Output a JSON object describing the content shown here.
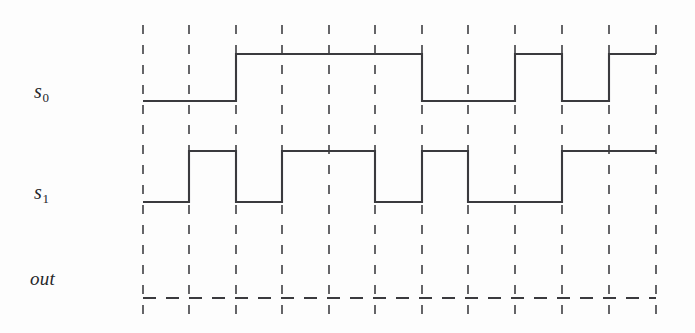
{
  "figure": {
    "type": "timing-diagram",
    "background_color": "#fdfdfd",
    "line_color": "#3a3a3e",
    "grid_color": "#4a4a4e"
  },
  "labels": {
    "s0": {
      "base": "s",
      "sub": "0",
      "full": "s0"
    },
    "s1": {
      "base": "s",
      "sub": "1",
      "full": "s1"
    },
    "out": {
      "full": "out"
    }
  },
  "chart_data": {
    "type": "line",
    "title": "",
    "xlabel": "",
    "ylabel": "",
    "grid": true,
    "legend_position": "left",
    "axis": {
      "x_start_px": 143,
      "x_end_px": 656,
      "cycle_width_px": 46.6,
      "gridline_count": 12,
      "gridlines_px": [
        143,
        189,
        236,
        282,
        329,
        375,
        422,
        468,
        515,
        562,
        609,
        656
      ],
      "gridline_top_px": 25,
      "gridline_bottom_px": 324
    },
    "series": [
      {
        "name": "s0",
        "label": "s0",
        "high_y_px": 54,
        "low_y_px": 101,
        "style": "solid",
        "values": [
          0,
          0,
          1,
          1,
          1,
          1,
          0,
          0,
          1,
          0,
          1
        ],
        "transitions_px": [
          {
            "x": 143,
            "level": 0
          },
          {
            "x": 236,
            "level": 1
          },
          {
            "x": 422,
            "level": 0
          },
          {
            "x": 515,
            "level": 1
          },
          {
            "x": 562,
            "level": 0
          },
          {
            "x": 609,
            "level": 1
          },
          {
            "x": 656,
            "level": 1
          }
        ]
      },
      {
        "name": "s1",
        "label": "s1",
        "high_y_px": 151,
        "low_y_px": 202,
        "style": "solid",
        "values": [
          0,
          1,
          0,
          1,
          1,
          0,
          1,
          0,
          0,
          1,
          1
        ],
        "transitions_px": [
          {
            "x": 143,
            "level": 0
          },
          {
            "x": 189,
            "level": 1
          },
          {
            "x": 236,
            "level": 0
          },
          {
            "x": 282,
            "level": 1
          },
          {
            "x": 375,
            "level": 0
          },
          {
            "x": 422,
            "level": 1
          },
          {
            "x": 468,
            "level": 0
          },
          {
            "x": 562,
            "level": 1
          },
          {
            "x": 656,
            "level": 1
          }
        ]
      },
      {
        "name": "out",
        "label": "out",
        "baseline_y_px": 298,
        "style": "dashed",
        "values": [],
        "note": "blank dashed baseline"
      }
    ]
  }
}
